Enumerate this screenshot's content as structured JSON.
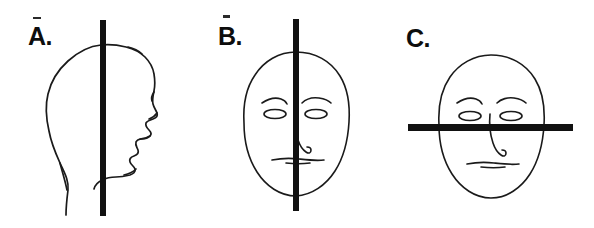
{
  "figure": {
    "background_color": "#ffffff",
    "ink_color": "#111111",
    "width": 594,
    "height": 228,
    "caption": ""
  },
  "panels": [
    {
      "id": "a",
      "label": "A.",
      "subject": "head-profile-right-facing",
      "drawing_style": "hand-drawn-line-outline",
      "plane": {
        "name": "vertical-bar",
        "orientation": "vertical",
        "color": "#111111",
        "thickness_px": 6,
        "position": "through-midline-of-profile"
      },
      "features": [
        "skull-outline",
        "forehead",
        "brow",
        "nose",
        "lips",
        "chin",
        "neck",
        "nape"
      ]
    },
    {
      "id": "b",
      "label": "B.",
      "subject": "face-frontal-oval",
      "drawing_style": "hand-drawn-line-outline",
      "plane": {
        "name": "vertical-bar",
        "orientation": "vertical",
        "color": "#111111",
        "thickness_px": 6,
        "position": "through-vertical-midline-of-face"
      },
      "features": [
        "face-oval",
        "left-eyebrow",
        "right-eyebrow",
        "left-eye",
        "right-eye",
        "nose",
        "mouth"
      ]
    },
    {
      "id": "c",
      "label": "C.",
      "subject": "face-frontal-oval",
      "drawing_style": "hand-drawn-line-outline",
      "plane": {
        "name": "horizontal-bar",
        "orientation": "horizontal",
        "color": "#111111",
        "thickness_px": 7,
        "position": "across-face-at-eye-nose-level"
      },
      "features": [
        "face-oval",
        "left-eyebrow",
        "right-eyebrow",
        "left-eye",
        "right-eye",
        "nose",
        "mouth"
      ]
    }
  ],
  "artifacts": {
    "speck_above_a": "scan-speck",
    "speck_above_b": "scan-speck"
  }
}
